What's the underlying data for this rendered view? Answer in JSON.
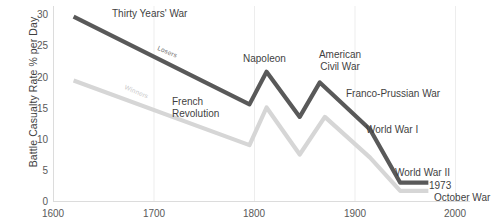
{
  "chart_data": {
    "type": "line",
    "title": "",
    "xlabel": "",
    "ylabel": "Battle Casualty Rate % per Day",
    "xlim": [
      1600,
      2000
    ],
    "ylim": [
      0,
      30
    ],
    "xticks": [
      "1600",
      "1700",
      "1800",
      "1900",
      "2000"
    ],
    "yticks": [
      "0",
      "5",
      "10",
      "15",
      "20",
      "25",
      "30"
    ],
    "grid": "vertical-only",
    "legend_position": "inline-on-lines",
    "series": [
      {
        "name": "Losers",
        "color": "#595959",
        "x": [
          1620,
          1795,
          1812,
          1845,
          1865,
          1915,
          1945,
          1973
        ],
        "values": [
          29.5,
          15.5,
          20.7,
          13.5,
          19.0,
          11.5,
          3.0,
          3.0
        ]
      },
      {
        "name": "Winners",
        "color": "#d6d6d6",
        "x": [
          1620,
          1795,
          1812,
          1845,
          1870,
          1915,
          1945,
          1973
        ],
        "values": [
          19.3,
          9.0,
          15.0,
          7.5,
          13.5,
          7.0,
          1.7,
          1.7
        ]
      }
    ],
    "annotations": [
      {
        "text": "Thirty Years' War",
        "x": 1630,
        "y": 29.8
      },
      {
        "text": "French Revolution",
        "x": 1748,
        "y": 14.2,
        "multiline": true
      },
      {
        "text": "Napoleon",
        "x": 1792,
        "y": 23.0
      },
      {
        "text": "American Civil War",
        "x": 1845,
        "y": 24.0,
        "multiline": true
      },
      {
        "text": "Franco-Prussian War",
        "x": 1884,
        "y": 18.0
      },
      {
        "text": "World War I",
        "x": 1900,
        "y": 10.5
      },
      {
        "text": "World War II",
        "x": 1920,
        "y": 4.6
      },
      {
        "text": "1973 October War",
        "x": 1962,
        "y": 2.6,
        "multiline": true
      }
    ],
    "series_tags": [
      {
        "text": "Losers",
        "series": "Losers"
      },
      {
        "text": "Winners",
        "series": "Winners"
      }
    ]
  },
  "axis": {
    "y_title": "Battle Casualty Rate % per Day",
    "y_ticks": [
      "30",
      "25",
      "20",
      "15",
      "10",
      "5",
      "0"
    ],
    "x_ticks": [
      "1600",
      "1700",
      "1800",
      "1900",
      "2000"
    ]
  },
  "annotations": {
    "thirty_years_war": "Thirty Years' War",
    "french_revolution_line1": "French",
    "french_revolution_line2": "Revolution",
    "napoleon": "Napoleon",
    "american_civil_war_line1": "American",
    "american_civil_war_line2": "Civil War",
    "franco_prussian_war": "Franco-Prussian War",
    "world_war_i": "World War I",
    "world_war_ii": "World War II",
    "october_war_line1": "1973",
    "october_war_line2": "October War"
  },
  "series_labels": {
    "losers": "Losers",
    "winners": "Winners"
  },
  "colors": {
    "losers_line": "#595959",
    "winners_line": "#d6d6d6",
    "text": "#3f3f3f",
    "tick_text": "#595959",
    "gridline": "#e8e8e8",
    "axis": "#d9d9d9",
    "background": "#ffffff"
  }
}
